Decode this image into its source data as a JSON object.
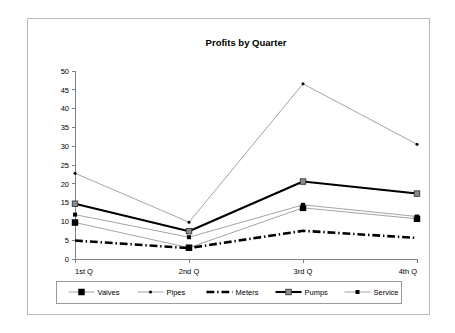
{
  "chart_data": {
    "type": "line",
    "title": "Profits by Quarter",
    "xlabel": "",
    "ylabel": "",
    "categories": [
      "1st Q",
      "2nd Q",
      "3rd Q",
      "4th Q"
    ],
    "ylim": [
      0,
      50
    ],
    "ytick_step": 5,
    "yticks": [
      "0",
      "5",
      "10",
      "15",
      "20",
      "25",
      "30",
      "35",
      "40",
      "45",
      "50"
    ],
    "grid": false,
    "legend_position": "bottom",
    "series": [
      {
        "name": "Valves",
        "values": [
          9.7,
          3.0,
          13.6,
          10.7
        ],
        "color": "#8c8c8c",
        "line_width": 0.8,
        "dash": "none",
        "marker": "square",
        "marker_size": 6.5,
        "marker_color": "#000000"
      },
      {
        "name": "Pipes",
        "values": [
          22.8,
          9.8,
          46.6,
          30.5
        ],
        "color": "#8c8c8c",
        "line_width": 0.8,
        "dash": "none",
        "marker": "circle",
        "marker_size": 3.0,
        "marker_color": "#000000"
      },
      {
        "name": "Meters",
        "values": [
          4.9,
          2.9,
          7.5,
          5.6
        ],
        "color": "#000000",
        "line_width": 2.6,
        "dash": "dashdot",
        "marker": "none",
        "marker_size": 0,
        "marker_color": "#000000"
      },
      {
        "name": "Pumps",
        "values": [
          14.7,
          7.4,
          20.6,
          17.4
        ],
        "color": "#000000",
        "line_width": 2.1,
        "dash": "none",
        "marker": "hatched-square",
        "marker_size": 5.5,
        "marker_color": "#8c8c8c"
      },
      {
        "name": "Service",
        "values": [
          11.8,
          5.8,
          14.4,
          11.3
        ],
        "color": "#8c8c8c",
        "line_width": 0.8,
        "dash": "none",
        "marker": "square",
        "marker_size": 4.0,
        "marker_color": "#000000"
      }
    ]
  },
  "figure": {
    "border_color": "#b9b9b9",
    "background": "#ffffff",
    "axis_color": "#808080"
  }
}
